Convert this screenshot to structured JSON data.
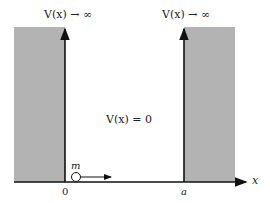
{
  "diagram": {
    "left_wall_label": "V(x) → ∞",
    "right_wall_label": "V(x) → ∞",
    "inside_label": "V(x) = 0",
    "particle_label": "m",
    "origin_label": "0",
    "right_edge_label": "a",
    "axis_label": "x",
    "colors": {
      "wall_fill": "#b3b3b3",
      "line": "#111111"
    }
  }
}
